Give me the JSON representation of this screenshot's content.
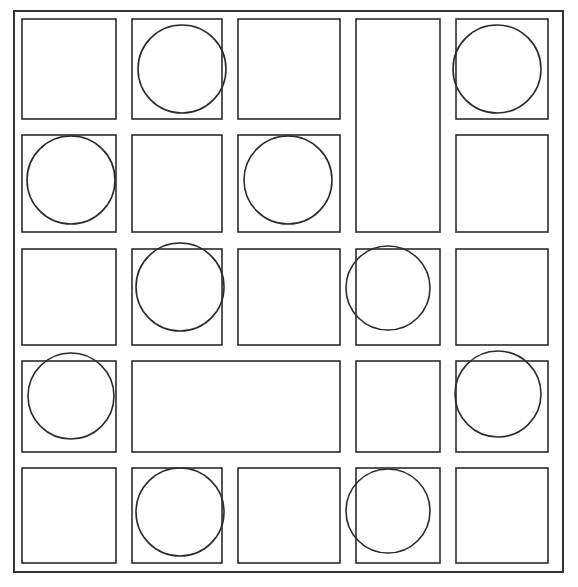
{
  "diagram": {
    "type": "grid-with-circles",
    "canvas": {
      "width": 578,
      "height": 587
    },
    "style": {
      "background_color": "#ffffff",
      "line_color": "#2b2b2b",
      "circle_color": "#2b2b2b",
      "line_width": 1.6
    },
    "grid": {
      "rows": 5,
      "columns": 5,
      "column_edges": [
        14,
        124,
        230,
        348,
        448,
        563
      ],
      "row_edges": [
        11,
        127,
        241,
        353,
        460,
        572
      ],
      "cell_inset": 8,
      "note": "Each cell is drawn as its own rectangle, producing paired lines at shared edges."
    },
    "cells": [
      {
        "id": "r1c1",
        "row": 1,
        "col": 1,
        "row_span": 1,
        "col_span": 1,
        "x": 14,
        "y": 11,
        "w": 102,
        "h": 108,
        "circle": false
      },
      {
        "id": "r1c2",
        "row": 1,
        "col": 2,
        "row_span": 1,
        "col_span": 1,
        "x": 124,
        "y": 11,
        "w": 98,
        "h": 108,
        "circle": true
      },
      {
        "id": "r1c3",
        "row": 1,
        "col": 3,
        "row_span": 1,
        "col_span": 1,
        "x": 230,
        "y": 11,
        "w": 110,
        "h": 108,
        "circle": false
      },
      {
        "id": "r1c4",
        "row": 1,
        "col": 4,
        "row_span": 2,
        "col_span": 1,
        "x": 348,
        "y": 11,
        "w": 92,
        "h": 221,
        "circle": false
      },
      {
        "id": "r1c5",
        "row": 1,
        "col": 5,
        "row_span": 1,
        "col_span": 1,
        "x": 448,
        "y": 11,
        "w": 100,
        "h": 108,
        "circle": true
      },
      {
        "id": "r2c1",
        "row": 2,
        "col": 1,
        "row_span": 1,
        "col_span": 1,
        "x": 14,
        "y": 127,
        "w": 102,
        "h": 105,
        "circle": true
      },
      {
        "id": "r2c2",
        "row": 2,
        "col": 2,
        "row_span": 1,
        "col_span": 1,
        "x": 124,
        "y": 127,
        "w": 98,
        "h": 105,
        "circle": false
      },
      {
        "id": "r2c3",
        "row": 2,
        "col": 3,
        "row_span": 1,
        "col_span": 1,
        "x": 230,
        "y": 127,
        "w": 110,
        "h": 105,
        "circle": true
      },
      {
        "id": "r2c5",
        "row": 2,
        "col": 5,
        "row_span": 1,
        "col_span": 1,
        "x": 448,
        "y": 127,
        "w": 100,
        "h": 105,
        "circle": false
      },
      {
        "id": "r3c1",
        "row": 3,
        "col": 1,
        "row_span": 1,
        "col_span": 1,
        "x": 14,
        "y": 241,
        "w": 102,
        "h": 104,
        "circle": false
      },
      {
        "id": "r3c2",
        "row": 3,
        "col": 2,
        "row_span": 1,
        "col_span": 1,
        "x": 124,
        "y": 241,
        "w": 98,
        "h": 104,
        "circle": true
      },
      {
        "id": "r3c3",
        "row": 3,
        "col": 3,
        "row_span": 1,
        "col_span": 1,
        "x": 230,
        "y": 241,
        "w": 110,
        "h": 104,
        "circle": false
      },
      {
        "id": "r3c4",
        "row": 3,
        "col": 4,
        "row_span": 1,
        "col_span": 1,
        "x": 348,
        "y": 241,
        "w": 92,
        "h": 104,
        "circle": true
      },
      {
        "id": "r3c5",
        "row": 3,
        "col": 5,
        "row_span": 1,
        "col_span": 1,
        "x": 448,
        "y": 241,
        "w": 100,
        "h": 104,
        "circle": false
      },
      {
        "id": "r4c1",
        "row": 4,
        "col": 1,
        "row_span": 1,
        "col_span": 1,
        "x": 14,
        "y": 353,
        "w": 102,
        "h": 99,
        "circle": true
      },
      {
        "id": "r4c23",
        "row": 4,
        "col": 2,
        "row_span": 1,
        "col_span": 2,
        "x": 124,
        "y": 353,
        "w": 216,
        "h": 99,
        "circle": false
      },
      {
        "id": "r4c4",
        "row": 4,
        "col": 4,
        "row_span": 1,
        "col_span": 1,
        "x": 348,
        "y": 353,
        "w": 92,
        "h": 99,
        "circle": false
      },
      {
        "id": "r4c5",
        "row": 4,
        "col": 5,
        "row_span": 1,
        "col_span": 1,
        "x": 448,
        "y": 353,
        "w": 100,
        "h": 99,
        "circle": true
      },
      {
        "id": "r5c1",
        "row": 5,
        "col": 1,
        "row_span": 1,
        "col_span": 1,
        "x": 14,
        "y": 460,
        "w": 102,
        "h": 103,
        "circle": false
      },
      {
        "id": "r5c2",
        "row": 5,
        "col": 2,
        "row_span": 1,
        "col_span": 1,
        "x": 124,
        "y": 460,
        "w": 98,
        "h": 103,
        "circle": true
      },
      {
        "id": "r5c3",
        "row": 5,
        "col": 3,
        "row_span": 1,
        "col_span": 1,
        "x": 230,
        "y": 460,
        "w": 110,
        "h": 103,
        "circle": false
      },
      {
        "id": "r5c4",
        "row": 5,
        "col": 4,
        "row_span": 1,
        "col_span": 1,
        "x": 348,
        "y": 460,
        "w": 92,
        "h": 103,
        "circle": true
      },
      {
        "id": "r5c5",
        "row": 5,
        "col": 5,
        "row_span": 1,
        "col_span": 1,
        "x": 448,
        "y": 460,
        "w": 100,
        "h": 103,
        "circle": false
      }
    ],
    "outer_frame": {
      "x": 14,
      "y": 11,
      "w": 549,
      "h": 561
    },
    "circles": [
      {
        "cell": "r1c2",
        "cx": 182,
        "cy": 69,
        "r": 44
      },
      {
        "cell": "r1c5",
        "cx": 497,
        "cy": 69,
        "r": 44
      },
      {
        "cell": "r2c1",
        "cx": 71,
        "cy": 180,
        "r": 44
      },
      {
        "cell": "r2c3",
        "cx": 288,
        "cy": 180,
        "r": 44
      },
      {
        "cell": "r3c2",
        "cx": 180,
        "cy": 287,
        "r": 44
      },
      {
        "cell": "r3c4",
        "cx": 388,
        "cy": 288,
        "r": 42
      },
      {
        "cell": "r4c1",
        "cx": 71,
        "cy": 396,
        "r": 43
      },
      {
        "cell": "r4c5",
        "cx": 498,
        "cy": 394,
        "r": 43
      },
      {
        "cell": "r5c2",
        "cx": 180,
        "cy": 512,
        "r": 44
      },
      {
        "cell": "r5c4",
        "cx": 388,
        "cy": 511,
        "r": 42
      }
    ],
    "circle_count": 10,
    "cell_count": 23
  }
}
